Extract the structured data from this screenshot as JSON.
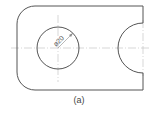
{
  "figure": {
    "caption": "(a)",
    "dimension_label": "ø20",
    "colors": {
      "outline": "#555555",
      "centerline": "#bdbdbd",
      "dimension": "#888888"
    }
  }
}
